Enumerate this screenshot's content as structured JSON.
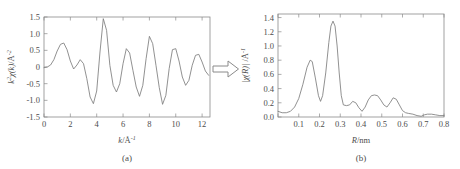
{
  "figure": {
    "truncated_header_text": "",
    "arrow_icon": "fourier-transform-arrow"
  },
  "panel_a": {
    "caption": "(a)",
    "xlabel_main": "k",
    "xlabel_unit": "/Å",
    "xlabel_exp": "-1",
    "ylabel_k": "k",
    "ylabel_k_exp": "2",
    "ylabel_chi": "χ(k)",
    "ylabel_unit": "/Å",
    "ylabel_unit_exp": "-2",
    "xticks": [
      "0",
      "2",
      "4",
      "6",
      "8",
      "10",
      "12"
    ],
    "yticks": [
      "1.5",
      "1.0",
      "0.5",
      "0",
      "-0.5",
      "-1.0",
      "-1.5"
    ]
  },
  "panel_b": {
    "caption": "(b)",
    "xlabel_main": "R",
    "xlabel_unit": "/nm",
    "ylabel_chi": "|χ(R)|",
    "ylabel_unit": " /Å",
    "ylabel_unit_exp": "-1",
    "xticks": [
      "0",
      "0.1",
      "0.2",
      "0.3",
      "0.4",
      "0.5",
      "0.6",
      "0.7",
      "0.8"
    ],
    "yticks": [
      "0.0",
      "0.2",
      "0.4",
      "0.6",
      "0.8",
      "1.0",
      "1.2",
      "1.4"
    ]
  },
  "chart_data": [
    {
      "type": "line",
      "title": "(a)",
      "xlabel": "k/Å⁻¹",
      "ylabel": "k²·χ(k)/Å⁻²",
      "xlim": [
        0,
        12.6
      ],
      "ylim": [
        -1.5,
        1.5
      ],
      "xticks": [
        0,
        2,
        4,
        6,
        8,
        10,
        12
      ],
      "yticks": [
        -1.5,
        -1.0,
        -0.5,
        0,
        0.5,
        1.0,
        1.5
      ],
      "grid": false,
      "legend": null,
      "x": [
        0.0,
        0.25,
        0.5,
        0.75,
        1.0,
        1.25,
        1.5,
        1.75,
        2.0,
        2.25,
        2.5,
        2.75,
        3.0,
        3.25,
        3.5,
        3.75,
        4.0,
        4.25,
        4.5,
        4.75,
        5.0,
        5.25,
        5.5,
        5.75,
        6.0,
        6.25,
        6.5,
        6.75,
        7.0,
        7.25,
        7.5,
        7.75,
        8.0,
        8.25,
        8.5,
        8.75,
        9.0,
        9.25,
        9.5,
        9.75,
        10.0,
        10.25,
        10.5,
        10.75,
        11.0,
        11.25,
        11.5,
        11.75,
        12.0,
        12.25,
        12.5
      ],
      "y": [
        -0.02,
        0.0,
        0.06,
        0.22,
        0.48,
        0.68,
        0.72,
        0.52,
        0.18,
        -0.06,
        0.06,
        0.22,
        0.1,
        -0.35,
        -0.9,
        -1.1,
        -0.72,
        0.45,
        1.45,
        1.1,
        0.05,
        -0.55,
        -0.75,
        -0.5,
        0.1,
        0.55,
        0.42,
        -0.1,
        -0.6,
        -0.88,
        -0.55,
        0.25,
        0.92,
        0.7,
        0.05,
        -0.62,
        -1.12,
        -0.85,
        -0.05,
        0.52,
        0.55,
        0.18,
        -0.3,
        -0.55,
        -0.4,
        0.05,
        0.35,
        0.38,
        0.15,
        -0.12,
        -0.25
      ],
      "note": "damped EXAFS oscillation decaying toward zero above k=9"
    },
    {
      "type": "line",
      "title": "(b)",
      "xlabel": "R/nm",
      "ylabel": "|χ(R)| /Å⁻¹",
      "xlim": [
        0,
        0.8
      ],
      "ylim": [
        0,
        1.45
      ],
      "xticks": [
        0,
        0.1,
        0.2,
        0.3,
        0.4,
        0.5,
        0.6,
        0.7,
        0.8
      ],
      "yticks": [
        0.0,
        0.2,
        0.4,
        0.6,
        0.8,
        1.0,
        1.2,
        1.4
      ],
      "grid": false,
      "legend": null,
      "x": [
        0.0,
        0.02,
        0.04,
        0.06,
        0.08,
        0.1,
        0.12,
        0.14,
        0.155,
        0.165,
        0.18,
        0.195,
        0.205,
        0.215,
        0.23,
        0.245,
        0.255,
        0.265,
        0.275,
        0.285,
        0.295,
        0.305,
        0.315,
        0.33,
        0.345,
        0.36,
        0.375,
        0.39,
        0.405,
        0.42,
        0.435,
        0.45,
        0.465,
        0.48,
        0.495,
        0.51,
        0.525,
        0.54,
        0.555,
        0.57,
        0.585,
        0.6,
        0.615,
        0.63,
        0.65,
        0.67,
        0.69,
        0.705,
        0.72,
        0.74,
        0.76,
        0.78,
        0.8
      ],
      "y": [
        0.08,
        0.06,
        0.06,
        0.08,
        0.14,
        0.26,
        0.46,
        0.7,
        0.8,
        0.78,
        0.55,
        0.3,
        0.22,
        0.3,
        0.62,
        1.05,
        1.28,
        1.35,
        1.28,
        1.0,
        0.62,
        0.3,
        0.17,
        0.16,
        0.17,
        0.22,
        0.2,
        0.13,
        0.08,
        0.14,
        0.24,
        0.3,
        0.31,
        0.3,
        0.24,
        0.17,
        0.14,
        0.2,
        0.27,
        0.25,
        0.17,
        0.09,
        0.06,
        0.05,
        0.04,
        0.02,
        0.01,
        0.03,
        0.04,
        0.04,
        0.03,
        0.02,
        0.02
      ],
      "note": "Fourier transform magnitude: shoulder peak 0.80 at R=0.155, main peak 1.35 at R=0.265"
    }
  ]
}
